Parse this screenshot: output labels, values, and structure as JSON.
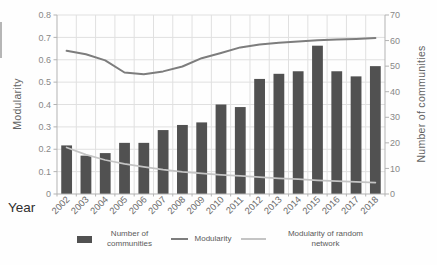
{
  "chart_data": {
    "type": "combo",
    "title": "",
    "x_axis": {
      "label": "Year"
    },
    "categories": [
      "2002",
      "2003",
      "2004",
      "2005",
      "2006",
      "2007",
      "2008",
      "2009",
      "2010",
      "2011",
      "2012",
      "2013",
      "2014",
      "2015",
      "2016",
      "2017",
      "2018"
    ],
    "left_axis": {
      "label": "Modularity",
      "min": 0,
      "max": 0.8,
      "ticks": [
        "0.8",
        "0.7",
        "0.6",
        "0.5",
        "0.4",
        "0.3",
        "0.2",
        "0.1",
        "0"
      ]
    },
    "right_axis": {
      "label": "Number of communities",
      "min": 0,
      "max": 70,
      "ticks": [
        "70",
        "60",
        "50",
        "40",
        "30",
        "20",
        "10",
        "0"
      ]
    },
    "series": [
      {
        "name": "Number of communities",
        "type": "bar",
        "axis": "right",
        "color": "#515151",
        "values": [
          19,
          15,
          16,
          20,
          20,
          25,
          27,
          28,
          35,
          34,
          45,
          47,
          48,
          58,
          48,
          46,
          50
        ]
      },
      {
        "name": "Modularity",
        "type": "line",
        "axis": "left",
        "color": "#7d7d7d",
        "values": [
          0.64,
          0.625,
          0.597,
          0.543,
          0.535,
          0.548,
          0.57,
          0.607,
          0.63,
          0.655,
          0.668,
          0.676,
          0.682,
          0.687,
          0.69,
          0.693,
          0.697
        ]
      },
      {
        "name": "Modularity of random network",
        "type": "line",
        "axis": "left",
        "color": "#c4c4c4",
        "values": [
          0.208,
          0.176,
          0.152,
          0.135,
          0.121,
          0.109,
          0.099,
          0.092,
          0.086,
          0.081,
          0.075,
          0.07,
          0.066,
          0.061,
          0.057,
          0.054,
          0.051
        ]
      }
    ],
    "grid": true,
    "legend_position": "bottom",
    "colors": {
      "gridline": "#e0e0e0",
      "axis_line": "#b3b3b3",
      "tick_label": "#888888",
      "x_tick_label": "#6b6b6b"
    }
  },
  "legend": {
    "items": [
      {
        "label": "Number of communities"
      },
      {
        "label": "Modularity"
      },
      {
        "label": "Modularity of random network"
      }
    ]
  }
}
